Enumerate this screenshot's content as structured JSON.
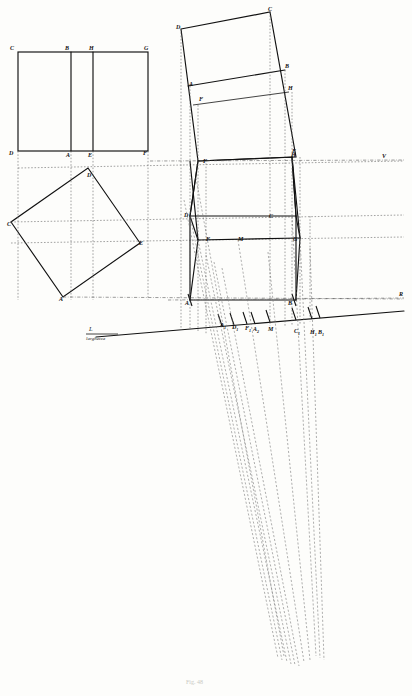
{
  "plate": {
    "title": "Prospettiva - costruzione di un prisma ruotato",
    "caption": "Fig. 48",
    "ink": "#111111",
    "paper": "#fdfdfb",
    "dotted": "#6f6f6f"
  },
  "measuring_line": {
    "symbol": "L",
    "name": "larghezza"
  },
  "horizon": {
    "vanishing_point_label": "V",
    "right_label": "R"
  },
  "elevation": {
    "name": "alzato",
    "top_labels": [
      {
        "text": "C",
        "x": 10,
        "y": 45
      },
      {
        "text": "B",
        "x": 65,
        "y": 45
      },
      {
        "text": "H",
        "x": 89,
        "y": 45
      },
      {
        "text": "G",
        "x": 144,
        "y": 45
      }
    ],
    "bottom_labels": [
      {
        "text": "D",
        "x": 9,
        "y": 150
      },
      {
        "text": "A",
        "x": 66,
        "y": 152
      },
      {
        "text": "E",
        "x": 88,
        "y": 152
      },
      {
        "text": "F",
        "x": 143,
        "y": 150
      }
    ]
  },
  "plan": {
    "name": "pianta",
    "labels": [
      {
        "text": "D",
        "x": 87,
        "y": 172
      },
      {
        "text": "C",
        "x": 7,
        "y": 221
      },
      {
        "text": "E",
        "x": 139,
        "y": 240
      },
      {
        "text": "A",
        "x": 59,
        "y": 296
      }
    ]
  },
  "tilted_face": {
    "name": "faccia ribaltata",
    "labels": [
      {
        "text": "D",
        "x": 176,
        "y": 24
      },
      {
        "text": "C",
        "x": 268,
        "y": 6
      },
      {
        "text": "A",
        "x": 189,
        "y": 81
      },
      {
        "text": "B",
        "x": 285,
        "y": 63
      },
      {
        "text": "F",
        "x": 199,
        "y": 96
      },
      {
        "text": "H",
        "x": 288,
        "y": 85
      },
      {
        "text": "E",
        "x": 292,
        "y": 148
      },
      {
        "text": "F",
        "x": 203,
        "y": 158
      }
    ]
  },
  "prism": {
    "name": "prisma in prospettiva",
    "labels": [
      {
        "text": "H",
        "x": 291,
        "y": 152
      },
      {
        "text": "D",
        "x": 184,
        "y": 212
      },
      {
        "text": "C",
        "x": 269,
        "y": 213
      },
      {
        "text": "F",
        "x": 206,
        "y": 236
      },
      {
        "text": "M",
        "x": 238,
        "y": 236
      },
      {
        "text": "G",
        "x": 293,
        "y": 236
      },
      {
        "text": "A",
        "x": 185,
        "y": 300
      },
      {
        "text": "B",
        "x": 288,
        "y": 300
      }
    ]
  },
  "ground_marks": {
    "name": "punti di misura sulla linea delle larghezze",
    "labels": [
      {
        "text": "A",
        "sub": "1",
        "x": 220,
        "y": 322
      },
      {
        "text": "D",
        "sub": "1",
        "x": 232,
        "y": 324
      },
      {
        "text": "F",
        "sub": "1",
        "x": 245,
        "y": 325
      },
      {
        "text": "A",
        "sub": "2",
        "x": 253,
        "y": 326
      },
      {
        "text": "M",
        "sub": "",
        "x": 268,
        "y": 326
      },
      {
        "text": "C",
        "sub": "1",
        "x": 294,
        "y": 328
      },
      {
        "text": "H",
        "sub": "1",
        "x": 310,
        "y": 329
      },
      {
        "text": "B",
        "sub": "1",
        "x": 318,
        "y": 329
      }
    ]
  }
}
